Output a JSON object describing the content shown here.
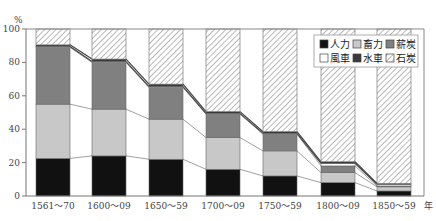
{
  "chart_data": {
    "type": "bar",
    "stacked": true,
    "percent": true,
    "title": "",
    "xlabel": "年",
    "ylabel": "%",
    "ylim": [
      0,
      100
    ],
    "yticks": [
      0,
      20,
      40,
      60,
      80,
      100
    ],
    "grid": false,
    "legend_position": "upper-right-inside",
    "categories": [
      "1561〜70",
      "1600〜09",
      "1650〜59",
      "1700〜09",
      "1750〜59",
      "1800〜09",
      "1850〜59"
    ],
    "series": [
      {
        "name": "人力",
        "pattern": "black",
        "values": [
          22.5,
          24,
          22,
          16,
          12,
          8,
          3
        ]
      },
      {
        "name": "畜力",
        "pattern": "light-gray",
        "values": [
          32.5,
          28,
          24,
          19,
          15,
          6,
          2.5
        ]
      },
      {
        "name": "薪炭",
        "pattern": "dark-gray",
        "values": [
          34,
          28,
          19,
          14,
          10,
          4,
          0.5
        ]
      },
      {
        "name": "風車",
        "pattern": "white",
        "values": [
          0.5,
          0.5,
          0.5,
          0.5,
          0.5,
          1.5,
          1
        ]
      },
      {
        "name": "水車",
        "pattern": "dark-band",
        "values": [
          1,
          1.5,
          1.5,
          1,
          1,
          1,
          0.5
        ]
      },
      {
        "name": "石炭",
        "pattern": "hatched",
        "values": [
          9.5,
          18,
          33,
          49.5,
          61.5,
          79.5,
          92.5
        ]
      }
    ]
  },
  "axis": {
    "y_unit": "%",
    "x_unit": "年",
    "y_ticks": [
      "0",
      "20",
      "40",
      "60",
      "80",
      "100"
    ]
  },
  "legend": {
    "items": [
      {
        "label": "人力",
        "color": "#111111"
      },
      {
        "label": "畜力",
        "color": "#c8c8c8"
      },
      {
        "label": "薪炭",
        "color": "#808080"
      },
      {
        "label": "風車",
        "color": "#ffffff"
      },
      {
        "label": "水車",
        "color": "#3a3a3a"
      },
      {
        "label": "石炭",
        "color": "hatch"
      }
    ]
  },
  "colors": {
    "black": "#111111",
    "light_gray": "#c8c8c8",
    "dark_gray": "#808080",
    "white": "#ffffff",
    "band": "#3a3a3a",
    "hatch_line": "#8a8a8a",
    "axis": "#777777"
  }
}
